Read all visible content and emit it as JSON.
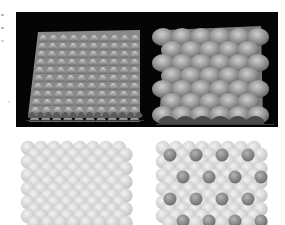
{
  "figure": {
    "panels": [
      {
        "id": "top-left",
        "type": "3d-surface",
        "background": "#050505",
        "surface_color": "#a8a8a8",
        "peak_columns": 10,
        "peak_rows": 11,
        "pattern": "sharp dense peaks"
      },
      {
        "id": "top-right",
        "type": "3d-surface",
        "background": "#050505",
        "surface_color": "#9a9a9a",
        "peak_columns": 5,
        "peak_rows": 7,
        "pattern": "rounded wide bumps"
      },
      {
        "id": "bottom-left",
        "type": "sphere-model",
        "sphere_color": "#dcdcdc",
        "adsorbate_color": null,
        "columns": 8,
        "rows": 6
      },
      {
        "id": "bottom-right",
        "type": "sphere-model",
        "sphere_color": "#dcdcdc",
        "adsorbate_color": "#8c8c8c",
        "columns": 8,
        "rows": 6,
        "adsorbate_rows": 4,
        "adsorbates_per_row": 4
      }
    ]
  }
}
